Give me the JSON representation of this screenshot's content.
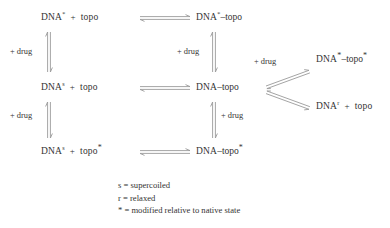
{
  "diagram": {
    "arrow_color": "#8e8e8e",
    "text_color": "#333333",
    "background": "#ffffff",
    "arrow_type": "equilibrium-double-harpoon",
    "species": {
      "dna_star": "DNA",
      "dna_s": "DNA",
      "dna_r": "DNA",
      "topo": "topo",
      "dna_star_topo": "DNA",
      "dna_topo": "DNA",
      "dna_topo_star": "DNA",
      "dna_star_topo_star": "DNA"
    },
    "rows": [
      {
        "id": "row-1",
        "left": {
          "label": "DNA* + topo",
          "a_base": "DNA",
          "a_sup": "*",
          "op": "+",
          "b_base": "topo",
          "b_sup": ""
        },
        "right": {
          "label": "DNA*–topo",
          "base": "DNA",
          "sup": "*",
          "tail": "–topo",
          "tail_sup": ""
        }
      },
      {
        "id": "row-2",
        "left": {
          "label": "DNAs + topo",
          "a_base": "DNA",
          "a_sup": "s",
          "op": "+",
          "b_base": "topo",
          "b_sup": ""
        },
        "right": {
          "label": "DNA–topo",
          "base": "DNA",
          "sup": "",
          "tail": "–topo",
          "tail_sup": ""
        }
      },
      {
        "id": "row-3",
        "left": {
          "label": "DNAs + topo*",
          "a_base": "DNA",
          "a_sup": "s",
          "op": "+",
          "b_base": "topo",
          "b_sup": "*"
        },
        "right": {
          "label": "DNA–topo*",
          "base": "DNA",
          "sup": "",
          "tail": "–topo",
          "tail_sup": "*"
        }
      }
    ],
    "branches": [
      {
        "id": "branch-upper",
        "label": "DNA*–topo*",
        "base": "DNA",
        "sup": "*",
        "tail": "–topo",
        "tail_sup": "*"
      },
      {
        "id": "branch-lower",
        "label": "DNAr + topo",
        "a_base": "DNA",
        "a_sup": "r",
        "op": "+",
        "b_base": "topo"
      }
    ],
    "drug_labels": [
      {
        "id": "drug-left-upper",
        "text": "+ drug"
      },
      {
        "id": "drug-middle-upper",
        "text": "+ drug"
      },
      {
        "id": "drug-branch",
        "text": "+ drug"
      },
      {
        "id": "drug-left-lower",
        "text": "+ drug"
      },
      {
        "id": "drug-middle-lower",
        "text": "+ drug"
      }
    ],
    "legend": [
      {
        "id": "legend-s",
        "symbol": "s",
        "eq": "=",
        "text": "supercoiled",
        "full": "s = supercoiled"
      },
      {
        "id": "legend-r",
        "symbol": "r",
        "eq": "=",
        "text": "relaxed",
        "full": "r = relaxed"
      },
      {
        "id": "legend-star",
        "symbol": "*",
        "eq": "=",
        "text": "modified relative to native state",
        "full": "* = modified relative to native state"
      }
    ]
  }
}
